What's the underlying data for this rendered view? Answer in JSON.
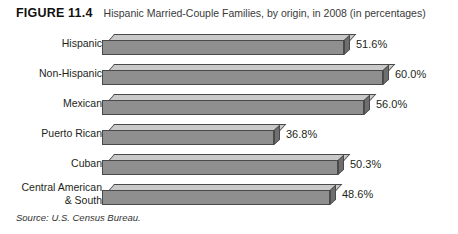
{
  "figure": {
    "number_label": "FIGURE 11.4",
    "title": "Hispanic Married-Couple Families, by origin, in 2008 (in percentages)",
    "source": "Source: U.S. Census Bureau."
  },
  "chart_data": {
    "type": "bar",
    "orientation": "horizontal",
    "title": "Hispanic Married-Couple Families, by origin, in 2008 (in percentages)",
    "xlabel": "",
    "ylabel": "",
    "xlim": [
      0,
      65
    ],
    "grid": false,
    "legend": "none",
    "value_suffix": "%",
    "categories": [
      "Hispanic",
      "Non-Hispanic",
      "Mexican",
      "Puerto Rican",
      "Cuban",
      "Central American\n& South"
    ],
    "values": [
      51.6,
      60.0,
      56.0,
      36.8,
      50.3,
      48.6
    ],
    "value_labels": [
      "51.6%",
      "60.0%",
      "56.0%",
      "36.8%",
      "50.3%",
      "48.6%"
    ]
  },
  "style": {
    "bar_front_color": "#8f8f8f",
    "bar_top_color": "#c9c9c9",
    "bar_side_color": "#6e6e6e",
    "bar_outline_color": "#4a4a4a",
    "text_color": "#231f20",
    "background": "#ffffff"
  }
}
